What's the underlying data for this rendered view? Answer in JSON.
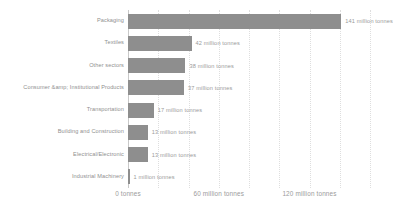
{
  "chart_data": {
    "type": "bar",
    "orientation": "horizontal",
    "title": "",
    "subtitle": "",
    "xlabel": "",
    "ylabel": "",
    "categories": [
      "Packaging",
      "Textiles",
      "Other sectors",
      "Consumer &amp; Institutional Products",
      "Transportation",
      "Building and Construction",
      "Electrical/Electronic",
      "Industrial Machinery"
    ],
    "values": [
      141,
      42,
      38,
      37,
      17,
      13,
      13,
      1
    ],
    "value_labels": [
      "141 million tonnes",
      "42 million tonnes",
      "38 million tonnes",
      "37 million tonnes",
      "17 million tonnes",
      "13 million tonnes",
      "13 million tonnes",
      "1 million tonnes"
    ],
    "unit": "million tonnes",
    "xlim": [
      0,
      160
    ],
    "xticks": [
      0,
      60,
      120
    ],
    "xtick_labels": [
      "0 tonnes",
      "60 million tonnes",
      "120 million tonnes"
    ],
    "gridline_values": [
      0,
      20,
      40,
      60,
      80,
      100,
      120,
      140,
      160
    ],
    "grid": true,
    "legend": "none",
    "bar_color": "#8e8e8e",
    "grid_color": "#dedede",
    "text_color": "#9a9a9a",
    "background": "#ffffff"
  }
}
